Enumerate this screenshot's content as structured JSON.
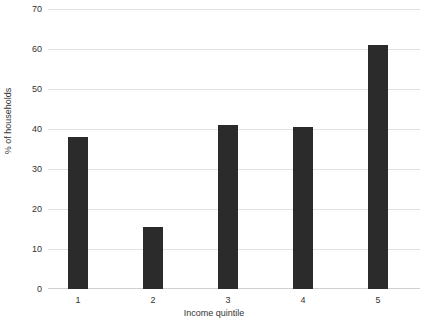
{
  "chart_data": {
    "type": "bar",
    "title": "",
    "subtitle": "",
    "xlabel": "Income quintile",
    "ylabel": "% of households",
    "categories": [
      "1",
      "2",
      "3",
      "4",
      "5"
    ],
    "values": [
      38,
      15.5,
      41,
      40.5,
      61
    ],
    "series": [
      {
        "name": "% of households",
        "values": [
          38,
          15.5,
          41,
          40.5,
          61
        ]
      }
    ],
    "ylim": [
      0,
      70
    ],
    "yticks": [
      0,
      10,
      20,
      30,
      40,
      50,
      60,
      70
    ],
    "ytick_labels": [
      "0",
      "10",
      "20",
      "30",
      "40",
      "50",
      "60",
      "70"
    ],
    "xtick_labels": [
      "1",
      "2",
      "3",
      "4",
      "5"
    ],
    "grid": "horizontal",
    "legend": "none",
    "colors": {
      "bar": "#2b2b2b",
      "gridline": "#e2e2e2",
      "axis": "#d0d0d0",
      "text": "#333333",
      "background": "#ffffff"
    }
  }
}
